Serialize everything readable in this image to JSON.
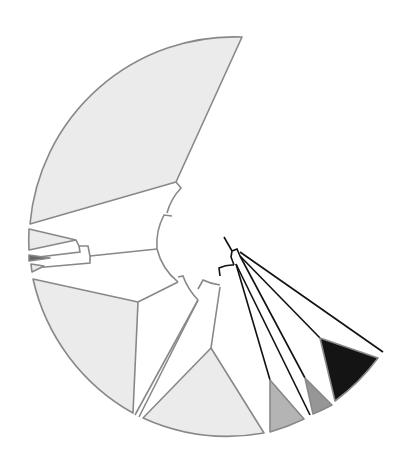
{
  "diagram": {
    "type": "circular-phylogenetic-tree",
    "text_labels": [],
    "colors": {
      "background": "#ffffff",
      "light_clade_fill": "#ebebeb",
      "clade_outline": "#888888",
      "mid_gray_fill": "#b4b4b4",
      "dark_gray_fill": "#969696",
      "black_clade_fill": "#141414",
      "black_branch": "#111111",
      "gray_branch": "#888888"
    },
    "collapsed_clades": [
      {
        "id": "clade-top-large",
        "fill": "light",
        "approx_span": "upper-left, largest"
      },
      {
        "id": "clade-left-small-1",
        "fill": "light"
      },
      {
        "id": "clade-left-small-dark",
        "fill": "dark"
      },
      {
        "id": "clade-left-small-2",
        "fill": "light"
      },
      {
        "id": "clade-lower-left-large",
        "fill": "light"
      },
      {
        "id": "clade-bottom-large",
        "fill": "light"
      },
      {
        "id": "clade-bottom-right-gray",
        "fill": "mid-gray"
      },
      {
        "id": "clade-right-gray",
        "fill": "dark-gray"
      },
      {
        "id": "clade-right-black",
        "fill": "black"
      }
    ]
  }
}
